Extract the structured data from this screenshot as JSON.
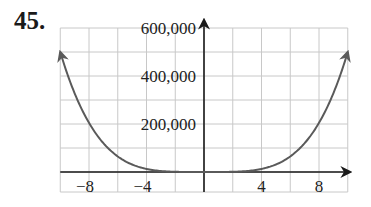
{
  "problem": {
    "number": "45."
  },
  "chart_data": {
    "type": "line",
    "title": "",
    "xlabel": "",
    "ylabel": "",
    "function_estimate": "y = 50x^4",
    "xlim": [
      -10,
      10
    ],
    "ylim": [
      0,
      600000
    ],
    "grid": true,
    "x_grid_step": 2,
    "y_grid_step": 100000,
    "x_tick_labels": [
      "−8",
      "−4",
      "4",
      "8"
    ],
    "x_ticks": [
      -8,
      -4,
      4,
      8
    ],
    "y_tick_labels": [
      "200,000",
      "400,000",
      "600,000"
    ],
    "y_ticks": [
      200000,
      400000,
      600000
    ],
    "series": [
      {
        "name": "curve",
        "color": "#5a5a5a",
        "x": [
          -10,
          -9,
          -8,
          -7,
          -6,
          -5,
          -4,
          -3,
          -2,
          -1,
          0,
          1,
          2,
          3,
          4,
          5,
          6,
          7,
          8,
          9,
          10
        ],
        "values": [
          500000,
          328050,
          204800,
          120050,
          64800,
          31250,
          12800,
          4050,
          800,
          50,
          0,
          50,
          800,
          4050,
          12800,
          31250,
          64800,
          120050,
          204800,
          328050,
          500000
        ]
      }
    ],
    "arrows": {
      "curve_ends": true,
      "x_axis": "right",
      "y_axis": "up"
    }
  },
  "colors": {
    "grid": "#c8c8c8",
    "axis": "#1a1a1a",
    "curve": "#5a5a5a"
  }
}
